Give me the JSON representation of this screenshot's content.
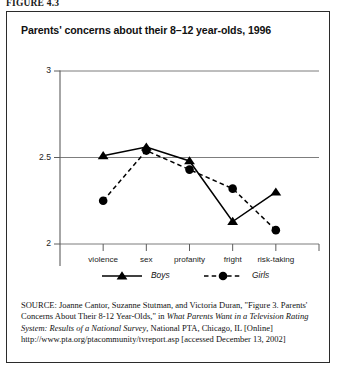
{
  "figure_label": "FIGURE 4.3",
  "chart_title": "Parents' concerns about their 8–12 year-olds, 1996",
  "source": {
    "prefix": "SOURCE:",
    "text_1": " Joanne Cantor, Suzanne Stutman, and Victoria Duran, \"Figure 3. Parents' Concerns About Their 8-12 Year-Olds,\" in ",
    "italic_1": "What Parents Want in a Television Rating System: Results of a National Survey",
    "text_2": ", National PTA, Chicago, IL [Online] http://www.pta.org/ptacommunity/tvreport.asp [accessed December 13, 2002]"
  },
  "chart_data": {
    "type": "line",
    "title": "Parents' concerns about their 8–12 year-olds, 1996",
    "xlabel": "",
    "ylabel": "",
    "categories": [
      "violence",
      "sex",
      "profanity",
      "fright",
      "risk-taking"
    ],
    "series": [
      {
        "name": "Boys",
        "marker": "triangle",
        "line": "solid",
        "values": [
          2.51,
          2.56,
          2.48,
          2.13,
          2.3
        ]
      },
      {
        "name": "Girls",
        "marker": "circle",
        "line": "dashed",
        "values": [
          2.25,
          2.54,
          2.43,
          2.32,
          2.08
        ]
      }
    ],
    "ylim": [
      2,
      3
    ],
    "yticks": [
      2,
      2.5,
      3
    ],
    "ytick_labels": [
      "2",
      "2.5",
      "3"
    ],
    "grid": "horizontal",
    "legend_position": "bottom",
    "legend": [
      "Boys",
      "Girls"
    ],
    "colors": {
      "boys": "#000000",
      "girls": "#000000",
      "axis": "#5d5d5d"
    }
  }
}
